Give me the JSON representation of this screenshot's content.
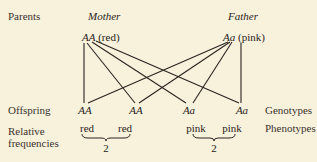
{
  "row_labels": {
    "parents": "Parents",
    "offspring": "Offspring",
    "relative_frequencies_1": "Relative",
    "relative_frequencies_2": "frequencies"
  },
  "column_labels": {
    "mother": "Mother",
    "father": "Father"
  },
  "parents": {
    "mother": {
      "genotype": "AA",
      "phenotype": "(red)"
    },
    "father": {
      "genotype": "Aa",
      "phenotype": "(pink)"
    }
  },
  "right_labels": {
    "genotypes": "Genotypes",
    "phenotypes": "Phenotypes"
  },
  "offspring": [
    {
      "genotype": "AA",
      "phenotype": "red"
    },
    {
      "genotype": "AA",
      "phenotype": "red"
    },
    {
      "genotype": "Aa",
      "phenotype": "pink"
    },
    {
      "genotype": "Aa",
      "phenotype": "pink"
    }
  ],
  "frequencies": [
    {
      "group": "red",
      "count": "2"
    },
    {
      "group": "pink",
      "count": "2"
    }
  ],
  "colors": {
    "background": "#f8f1dc",
    "ink": "#2a2420"
  }
}
